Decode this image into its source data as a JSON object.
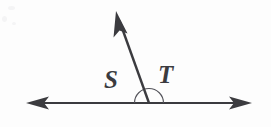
{
  "figure": {
    "kind": "geometry-diagram",
    "width": 271,
    "height": 127,
    "background_color": "#fdfdfd",
    "stroke_color": "#3b3b3f",
    "label_color": "#3b3b3f"
  },
  "labels": {
    "left_angle": "S",
    "right_angle": "T"
  },
  "label_positions": {
    "left_angle": {
      "x": 104,
      "y": 88
    },
    "right_angle": {
      "x": 158,
      "y": 83
    }
  },
  "geometry": {
    "vertex": {
      "x": 149,
      "y": 103
    },
    "baseline": {
      "name": "straight-line",
      "y": 103,
      "left_tip_x": 26,
      "right_tip_x": 252,
      "stroke_width": 2.2
    },
    "ray": {
      "name": "ray-upward",
      "from": {
        "x": 149,
        "y": 103
      },
      "to": {
        "x": 117,
        "y": 14
      },
      "stroke_width": 2.4
    },
    "arc": {
      "name": "angle-arc",
      "center": {
        "x": 149,
        "y": 103
      },
      "radius": 14.5,
      "start_angle_deg": 180,
      "end_angle_deg": 0,
      "stroke_width": 1.1
    },
    "arrowheads": [
      {
        "name": "arrowhead-left",
        "tip": {
          "x": 26,
          "y": 103
        },
        "direction": "left"
      },
      {
        "name": "arrowhead-right",
        "tip": {
          "x": 252,
          "y": 103
        },
        "direction": "right"
      },
      {
        "name": "arrowhead-up",
        "tip": {
          "x": 116,
          "y": 11
        },
        "direction": "up-left"
      }
    ]
  }
}
